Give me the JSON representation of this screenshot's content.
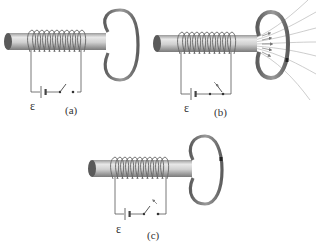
{
  "figure": {
    "panels": [
      {
        "id": "a",
        "label": "(a)",
        "emf_symbol": "ε",
        "switch_state": "open",
        "field_lines": false,
        "ring_current_mark": false
      },
      {
        "id": "b",
        "label": "(b)",
        "emf_symbol": "ε",
        "switch_state": "closing",
        "field_lines": true,
        "ring_current_mark": true
      },
      {
        "id": "c",
        "label": "(c)",
        "emf_symbol": "ε",
        "switch_state": "opening",
        "field_lines": false,
        "ring_current_mark": true
      }
    ]
  },
  "colors": {
    "core_light": "#e0e0e0",
    "core_dark": "#8a8a8a",
    "core_end": "#5a5a5a",
    "ring": "#707070",
    "wire": "#555555",
    "field_line": "#b5b5b5",
    "arrow": "#777777"
  }
}
